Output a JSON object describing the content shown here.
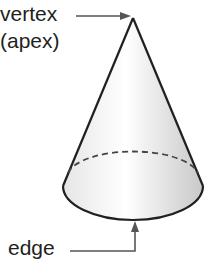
{
  "figure": {
    "labels": {
      "vertex": "vertex",
      "apex": "(apex)",
      "edge": "edge"
    },
    "colors": {
      "stroke": "#231f20",
      "arrow": "#555555",
      "fill_light": "#ffffff",
      "fill_shade": "#cfcfcf"
    }
  }
}
